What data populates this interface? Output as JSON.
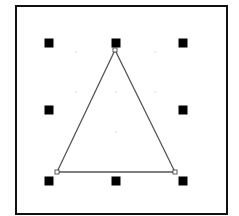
{
  "canvas": {
    "width": 239,
    "height": 216,
    "background": "#ffffff"
  },
  "frame": {
    "x": 16,
    "y": 6,
    "width": 211,
    "height": 208,
    "stroke": "#111111",
    "stroke_width": 2
  },
  "shape": {
    "type": "triangle",
    "stroke": "#555555",
    "points": [
      [
        115,
        50
      ],
      [
        57,
        172
      ],
      [
        175,
        172
      ]
    ],
    "vertex_markers": [
      [
        115,
        50
      ],
      [
        57,
        172
      ],
      [
        175,
        172
      ]
    ]
  },
  "selection_handles": [
    {
      "name": "top-left",
      "x": 49,
      "y": 43
    },
    {
      "name": "top-center",
      "x": 116,
      "y": 43
    },
    {
      "name": "top-right",
      "x": 183,
      "y": 43
    },
    {
      "name": "middle-left",
      "x": 49,
      "y": 110
    },
    {
      "name": "middle-right",
      "x": 183,
      "y": 110
    },
    {
      "name": "bottom-left",
      "x": 49,
      "y": 181
    },
    {
      "name": "bottom-center",
      "x": 116,
      "y": 181
    },
    {
      "name": "bottom-right",
      "x": 183,
      "y": 181
    }
  ],
  "handle_size": 9,
  "handle_color": "#000000",
  "grid_dots": [
    [
      76,
      52
    ],
    [
      155,
      52
    ],
    [
      76,
      92
    ],
    [
      116,
      92
    ],
    [
      155,
      92
    ],
    [
      116,
      132
    ]
  ],
  "grid_dot_color": "#c8c8c8"
}
